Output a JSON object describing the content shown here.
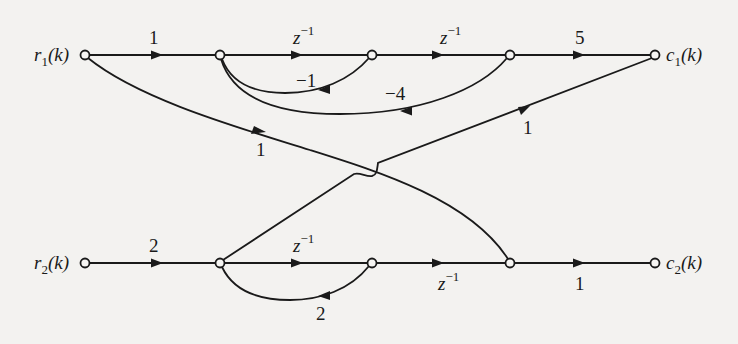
{
  "diagram": {
    "type": "signal-flow-graph",
    "inputs": [
      {
        "id": "r1",
        "var": "r",
        "sub": "1",
        "arg": "(k)"
      },
      {
        "id": "r2",
        "var": "r",
        "sub": "2",
        "arg": "(k)"
      }
    ],
    "outputs": [
      {
        "id": "c1",
        "var": "c",
        "sub": "1",
        "arg": "(k)"
      },
      {
        "id": "c2",
        "var": "c",
        "sub": "2",
        "arg": "(k)"
      }
    ],
    "gains": {
      "r1_to_n1": "1",
      "n1_to_n2_var": "z",
      "n1_to_n2_exp": "−1",
      "n2_to_n3_var": "z",
      "n2_to_n3_exp": "−1",
      "n3_to_c1": "5",
      "n2_to_n1_feedback": "−1",
      "n3_to_n1_feedback": "−4",
      "r1_to_m3_cross": "1",
      "m1_to_c1_cross": "1",
      "r2_to_m1": "2",
      "m1_to_m2_var": "z",
      "m1_to_m2_exp": "−1",
      "m2_to_m3_var": "z",
      "m2_to_m3_exp": "−1",
      "m3_to_c2": "1",
      "m2_to_m1_feedback": "2"
    },
    "edges": [
      {
        "from": "r1",
        "to": "n1",
        "gain": "1"
      },
      {
        "from": "n1",
        "to": "n2",
        "gain": "z^-1"
      },
      {
        "from": "n2",
        "to": "n3",
        "gain": "z^-1"
      },
      {
        "from": "n3",
        "to": "c1",
        "gain": "5"
      },
      {
        "from": "n2",
        "to": "n1",
        "gain": "-1"
      },
      {
        "from": "n3",
        "to": "n1",
        "gain": "-4"
      },
      {
        "from": "r1",
        "to": "m3",
        "gain": "1"
      },
      {
        "from": "m1",
        "to": "c1",
        "gain": "1"
      },
      {
        "from": "r2",
        "to": "m1",
        "gain": "2"
      },
      {
        "from": "m1",
        "to": "m2",
        "gain": "z^-1"
      },
      {
        "from": "m2",
        "to": "m3",
        "gain": "z^-1"
      },
      {
        "from": "m3",
        "to": "c2",
        "gain": "1"
      },
      {
        "from": "m2",
        "to": "m1",
        "gain": "2"
      }
    ]
  }
}
